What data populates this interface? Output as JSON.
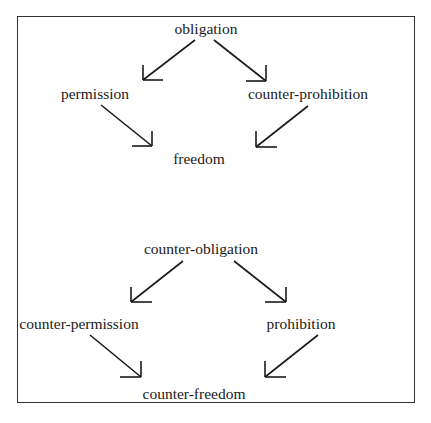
{
  "diagram": {
    "top": {
      "nodes": {
        "top": "obligation",
        "left": "permission",
        "right": "counter-prohibition",
        "bottom": "freedom"
      },
      "edges": [
        {
          "from": "obligation",
          "to": "permission"
        },
        {
          "from": "obligation",
          "to": "counter-prohibition"
        },
        {
          "from": "permission",
          "to": "freedom"
        },
        {
          "from": "counter-prohibition",
          "to": "freedom"
        }
      ]
    },
    "bottom": {
      "nodes": {
        "top": "counter-obligation",
        "left": "counter-permission",
        "right": "prohibition",
        "bottom": "counter-freedom"
      },
      "edges": [
        {
          "from": "counter-obligation",
          "to": "counter-permission"
        },
        {
          "from": "counter-obligation",
          "to": "prohibition"
        },
        {
          "from": "counter-permission",
          "to": "counter-freedom"
        },
        {
          "from": "prohibition",
          "to": "counter-freedom"
        }
      ]
    },
    "colors": {
      "ink": "#1a1a1a",
      "frame": "#333333",
      "background": "#ffffff"
    }
  }
}
